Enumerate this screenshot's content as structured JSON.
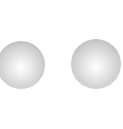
{
  "spheres": [
    {
      "name": "left-sphere",
      "cx": 21,
      "cy": 65,
      "r": 24,
      "color_center": "#ffffff",
      "color_edge": "#a6a6a6"
    },
    {
      "name": "right-sphere",
      "cx": 96,
      "cy": 64,
      "r": 25,
      "color_center": "#ffffff",
      "color_edge": "#a6a6a6"
    }
  ]
}
